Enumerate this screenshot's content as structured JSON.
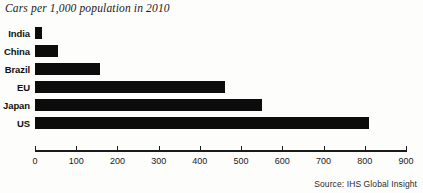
{
  "chart_data": {
    "type": "bar",
    "orientation": "horizontal",
    "title": "Cars per 1,000 population in 2010",
    "xlabel": "",
    "ylabel": "",
    "categories": [
      "India",
      "China",
      "Brazil",
      "EU",
      "Japan",
      "US"
    ],
    "values": [
      18,
      56,
      158,
      460,
      550,
      810
    ],
    "xlim": [
      0,
      900
    ],
    "xticks": [
      0,
      100,
      200,
      300,
      400,
      500,
      600,
      700,
      800,
      900
    ],
    "xtick_labels": [
      "0",
      "100",
      "200",
      "300",
      "400",
      "500",
      "600",
      "700",
      "800",
      "900"
    ],
    "grid": false,
    "legend": null,
    "bar_color": "#0c0c0c",
    "axis_color": "#1a1a1a",
    "background_color": "#fdfdfb",
    "source": "Source: IHS Global Insight"
  }
}
